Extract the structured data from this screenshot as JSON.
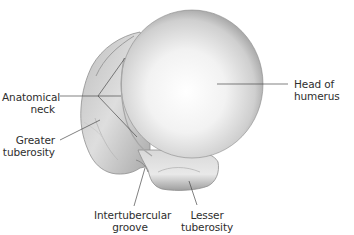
{
  "diagram": {
    "colors": {
      "background": "#ffffff",
      "bone_edge": "#8a8a8a",
      "bone_mid": "#c8c8c8",
      "bone_highlight": "#fbfbfb",
      "leader_line": "#4a4a4a",
      "label_text": "#2e2e2e"
    },
    "labels": {
      "anatomical_neck": {
        "line1": "Anatomical",
        "line2": "neck"
      },
      "greater_tuberosity": {
        "line1": "Greater",
        "line2": "tuberosity"
      },
      "head_of_humerus": {
        "line1": "Head of",
        "line2": "humerus"
      },
      "intertubercular_groove": {
        "line1": "Intertubercular",
        "line2": "groove"
      },
      "lesser_tuberosity": {
        "line1": "Lesser",
        "line2": "tuberosity"
      }
    }
  }
}
